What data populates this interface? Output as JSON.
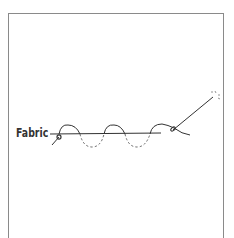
{
  "diagram": {
    "title": "",
    "labels": {
      "fabric": "Fabric"
    },
    "elements": [
      "fabric-line",
      "running-stitch-thread-above",
      "running-stitch-thread-below-dashed",
      "knot",
      "needle"
    ],
    "colors": {
      "line": "#333333",
      "frame": "#8a8a8a",
      "background": "#ffffff"
    }
  }
}
